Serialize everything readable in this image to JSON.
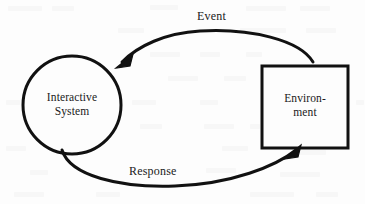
{
  "diagram": {
    "background_color": "#fdfdfd",
    "stroke_color": "#111111",
    "text_color": "#1a1a1a",
    "nodes": [
      {
        "id": "interactive-system",
        "shape": "circle",
        "label": "Interactive\nSystem",
        "cx": 72,
        "cy": 105,
        "r": 49
      },
      {
        "id": "environment",
        "shape": "rectangle",
        "label": "Environ-\nment",
        "x": 262,
        "y": 66,
        "width": 86,
        "height": 82
      }
    ],
    "edges": [
      {
        "id": "event-edge",
        "label": "Event",
        "from": "environment",
        "to": "interactive-system",
        "direction": "right-to-left",
        "path_position": "top"
      },
      {
        "id": "response-edge",
        "label": "Response",
        "from": "interactive-system",
        "to": "environment",
        "direction": "left-to-right",
        "path_position": "bottom"
      }
    ]
  }
}
